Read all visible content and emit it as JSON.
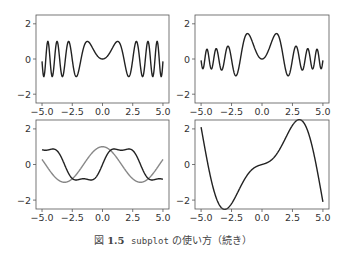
{
  "caption": {
    "prefix": "図",
    "number": "1.5",
    "code": "subplot",
    "text": " の使い方（続き）"
  },
  "chart_data": [
    {
      "type": "line",
      "title": "",
      "position": "top-left",
      "xlim": [
        -5.5,
        5.5
      ],
      "ylim": [
        -2.5,
        2.5
      ],
      "xticks": [
        "−5.0",
        "−2.5",
        "0.0",
        "2.5",
        "5.0"
      ],
      "yticks": [
        "−2",
        "0",
        "2"
      ],
      "series": [
        {
          "name": "sin(x^2)",
          "color": "#222222",
          "expr": "sin(x*x)"
        }
      ]
    },
    {
      "type": "line",
      "title": "",
      "position": "top-right",
      "xlim": [
        -5.5,
        5.5
      ],
      "ylim": [
        -2.5,
        2.5
      ],
      "xticks": [
        "−5.0",
        "−2.5",
        "0.0",
        "2.5",
        "5.0"
      ],
      "yticks": [
        "−2",
        "0",
        "2"
      ],
      "series": [
        {
          "name": "sin(x^2)*envelope",
          "color": "#222222",
          "expr": "sin(x*x)*(0.55+1.3*exp(-0.25*x*x))"
        }
      ]
    },
    {
      "type": "line",
      "title": "",
      "position": "bottom-left",
      "xlim": [
        -5.5,
        5.5
      ],
      "ylim": [
        -2.5,
        2.5
      ],
      "xticks": [
        "−5.0",
        "−2.5",
        "0.0",
        "2.5",
        "5.0"
      ],
      "yticks": [
        "−2",
        "0",
        "2"
      ],
      "series": [
        {
          "name": "cos(x)",
          "color": "#888888",
          "expr": "cos(x)"
        },
        {
          "name": "sin-like",
          "color": "#222222",
          "expr": "sin(x)+0.2*sin(3*x)"
        }
      ]
    },
    {
      "type": "line",
      "title": "",
      "position": "bottom-right",
      "xlim": [
        -5.5,
        5.5
      ],
      "ylim": [
        -2.5,
        2.5
      ],
      "xticks": [
        "−5.0",
        "−2.5",
        "0.0",
        "2.5",
        "5.0"
      ],
      "yticks": [
        "−2",
        "0",
        "2"
      ],
      "series": [
        {
          "name": "sin(x)-0.8x cos(x)",
          "color": "#222222",
          "expr": "sin(x)-0.8*x*cos(x)"
        }
      ]
    }
  ]
}
